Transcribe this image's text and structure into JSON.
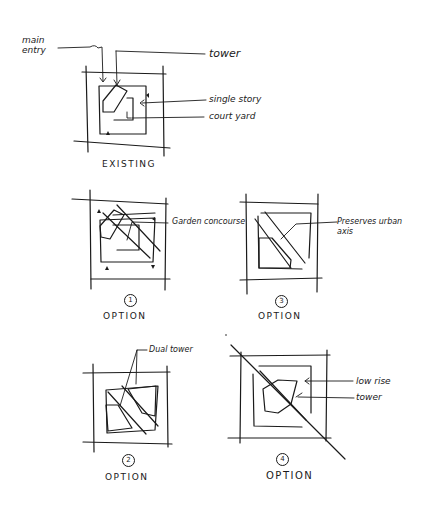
{
  "existing": {
    "caption": "EXISTING",
    "labels": {
      "main_entry_line1": "main",
      "main_entry_line2": "entry",
      "tower": "tower",
      "single_story": "single story",
      "court_yard": "court yard"
    }
  },
  "options": [
    {
      "number": "1",
      "caption": "OPTION",
      "label": "Garden concourse"
    },
    {
      "number": "2",
      "caption": "OPTION",
      "label": "Dual tower"
    },
    {
      "number": "3",
      "caption": "OPTION",
      "label_line1": "Preserves urban",
      "label_line2": "axis"
    },
    {
      "number": "4",
      "caption": "OPTION",
      "label_low_rise": "low rise",
      "label_tower": "tower"
    }
  ],
  "colors": {
    "ink": "#1a1a1a",
    "paper": "#ffffff"
  }
}
